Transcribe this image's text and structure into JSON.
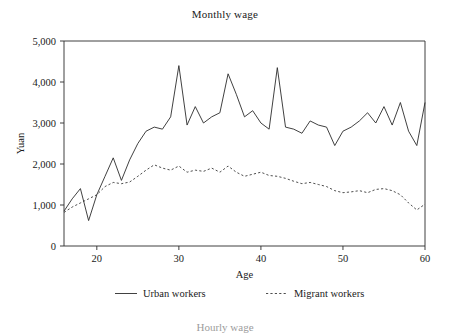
{
  "figure": {
    "title": "Monthly wage",
    "next_chart_title_partial": "Hourly wage"
  },
  "axes": {
    "y_title": "Yuan",
    "x_title": "Age",
    "y_ticks": [
      "0",
      "1,000",
      "2,000",
      "3,000",
      "4,000",
      "5,000"
    ],
    "x_ticks": [
      "20",
      "30",
      "40",
      "50",
      "60"
    ]
  },
  "legend": {
    "items": [
      {
        "label": "Urban workers",
        "style": "solid"
      },
      {
        "label": "Migrant workers",
        "style": "dotted"
      }
    ]
  },
  "chart_data": {
    "type": "line",
    "title": "Monthly wage",
    "xlabel": "Age",
    "ylabel": "Yuan",
    "xlim": [
      16,
      60
    ],
    "ylim": [
      0,
      5000
    ],
    "xticks": [
      20,
      30,
      40,
      50,
      60
    ],
    "yticks": [
      0,
      1000,
      2000,
      3000,
      4000,
      5000
    ],
    "grid": false,
    "legend_position": "below-axes",
    "x": [
      16,
      17,
      18,
      19,
      20,
      21,
      22,
      23,
      24,
      25,
      26,
      27,
      28,
      29,
      30,
      31,
      32,
      33,
      34,
      35,
      36,
      37,
      38,
      39,
      40,
      41,
      42,
      43,
      44,
      45,
      46,
      47,
      48,
      49,
      50,
      51,
      52,
      53,
      54,
      55,
      56,
      57,
      58,
      59,
      60
    ],
    "series": [
      {
        "name": "Urban workers",
        "style": "solid",
        "values": [
          850,
          1150,
          1400,
          620,
          1250,
          1700,
          2150,
          1600,
          2100,
          2500,
          2800,
          2900,
          2850,
          3150,
          4400,
          2950,
          3400,
          3000,
          3150,
          3250,
          4200,
          3700,
          3150,
          3300,
          3000,
          2850,
          4350,
          2900,
          2850,
          2750,
          3050,
          2950,
          2900,
          2450,
          2800,
          2900,
          3050,
          3250,
          3000,
          3400,
          2950,
          3500,
          2800,
          2450,
          3500
        ]
      },
      {
        "name": "Migrant workers",
        "style": "dotted",
        "values": [
          820,
          950,
          1050,
          1150,
          1250,
          1450,
          1550,
          1520,
          1560,
          1700,
          1850,
          1980,
          1900,
          1850,
          1950,
          1800,
          1850,
          1820,
          1900,
          1800,
          1950,
          1800,
          1700,
          1750,
          1800,
          1720,
          1700,
          1650,
          1580,
          1520,
          1550,
          1500,
          1450,
          1350,
          1300,
          1320,
          1350,
          1300,
          1380,
          1400,
          1350,
          1250,
          1050,
          880,
          1020
        ]
      }
    ]
  }
}
